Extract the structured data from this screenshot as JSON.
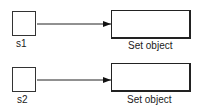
{
  "diagram": {
    "rows": [
      {
        "source_label": "s1",
        "target_label": "Set object"
      },
      {
        "source_label": "s2",
        "target_label": "Set object"
      }
    ]
  }
}
